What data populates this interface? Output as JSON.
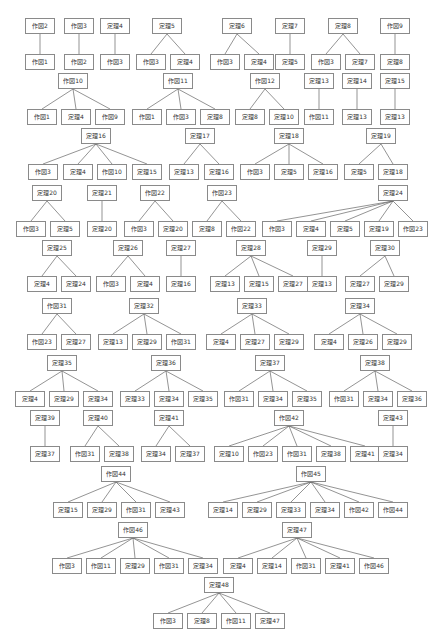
{
  "diagram": {
    "type": "dependency-trees",
    "trees": [
      {
        "root": "作図2",
        "children": [
          "作図1"
        ]
      },
      {
        "root": "作図3",
        "children": [
          "作図2"
        ]
      },
      {
        "root": "定理4",
        "children": [
          "作図3"
        ]
      },
      {
        "root": "定理5",
        "children": [
          "作図3",
          "定理4"
        ]
      },
      {
        "root": "定理6",
        "children": [
          "作図3",
          "定理4"
        ]
      },
      {
        "root": "定理7",
        "children": [
          "定理5"
        ]
      },
      {
        "root": "定理8",
        "children": [
          "作図3",
          "定理7"
        ]
      },
      {
        "root": "作図9",
        "children": [
          "定理8"
        ]
      },
      {
        "root": "作図10",
        "children": [
          "作図1",
          "定理4",
          "作図9"
        ]
      },
      {
        "root": "作図11",
        "children": [
          "作図1",
          "作図3",
          "定理8"
        ]
      },
      {
        "root": "作図12",
        "children": [
          "定理8",
          "定理10"
        ]
      },
      {
        "root": "定理13",
        "children": [
          "作図11"
        ]
      },
      {
        "root": "定理14",
        "children": [
          "定理13"
        ]
      },
      {
        "root": "定理15",
        "children": [
          "定理13"
        ]
      },
      {
        "root": "定理16",
        "children": [
          "作図3",
          "定理4",
          "作図10",
          "定理15"
        ]
      },
      {
        "root": "定理17",
        "children": [
          "定理13",
          "定理16"
        ]
      },
      {
        "root": "定理18",
        "children": [
          "作図3",
          "定理5",
          "定理16"
        ]
      },
      {
        "root": "定理19",
        "children": [
          "定理5",
          "定理18"
        ]
      },
      {
        "root": "定理20",
        "children": [
          "作図3",
          "定理5"
        ]
      },
      {
        "root": "定理21",
        "children": [
          "定理20"
        ]
      },
      {
        "root": "作図22",
        "children": [
          "作図3",
          "定理20"
        ]
      },
      {
        "root": "作図23",
        "children": [
          "定理8",
          "作図22"
        ]
      },
      {
        "root": "定理24",
        "children": [
          "作図3",
          "定理4",
          "定理5",
          "定理19",
          "作図23"
        ]
      },
      {
        "root": "定理25",
        "children": [
          "定理4",
          "定理24"
        ]
      },
      {
        "root": "定理26",
        "children": [
          "作図3",
          "定理4"
        ]
      },
      {
        "root": "定理27",
        "children": [
          "定理16"
        ]
      },
      {
        "root": "定理28",
        "children": [
          "定理13",
          "定理15",
          "定理27"
        ]
      },
      {
        "root": "定理29",
        "children": [
          "定理13"
        ]
      },
      {
        "root": "定理30",
        "children": [
          "定理27",
          "定理29"
        ]
      },
      {
        "root": "作図31",
        "children": [
          "作図23",
          "定理27"
        ]
      },
      {
        "root": "定理32",
        "children": [
          "定理13",
          "定理29",
          "作図31"
        ]
      },
      {
        "root": "定理33",
        "children": [
          "定理4",
          "定理27",
          "定理29"
        ]
      },
      {
        "root": "定理34",
        "children": [
          "定理4",
          "定理26",
          "定理29"
        ]
      },
      {
        "root": "定理35",
        "children": [
          "定理4",
          "定理29",
          "定理34"
        ]
      },
      {
        "root": "定理36",
        "children": [
          "定理33",
          "定理34",
          "定理35"
        ]
      },
      {
        "root": "定理37",
        "children": [
          "作図31",
          "定理34",
          "定理35"
        ]
      },
      {
        "root": "定理38",
        "children": [
          "作図31",
          "定理34",
          "定理36"
        ]
      },
      {
        "root": "定理39",
        "children": [
          "定理37"
        ]
      },
      {
        "root": "定理40",
        "children": [
          "作図31",
          "定理38"
        ]
      },
      {
        "root": "定理41",
        "children": [
          "定理34",
          "定理37"
        ]
      },
      {
        "root": "作図42",
        "children": [
          "定理10",
          "作図23",
          "作図31",
          "定理38",
          "定理41"
        ]
      },
      {
        "root": "定理43",
        "children": [
          "定理34"
        ]
      },
      {
        "root": "作図44",
        "children": [
          "定理15",
          "定理29",
          "作図31",
          "定理43"
        ]
      },
      {
        "root": "作図45",
        "children": [
          "定理14",
          "定理29",
          "定理33",
          "定理34",
          "作図42",
          "作図44"
        ]
      },
      {
        "root": "作図46",
        "children": [
          "作図3",
          "作図11",
          "定理29",
          "作図31",
          "定理34"
        ]
      },
      {
        "root": "定理47",
        "children": [
          "定理4",
          "定理14",
          "作図31",
          "定理41",
          "作図46"
        ]
      },
      {
        "root": "定理48",
        "children": [
          "作図3",
          "定理8",
          "作図11",
          "定理47"
        ]
      }
    ]
  },
  "colors": {
    "border": "#8a8a8a",
    "edge": "#666666",
    "text": "#333333",
    "background": "#ffffff"
  }
}
